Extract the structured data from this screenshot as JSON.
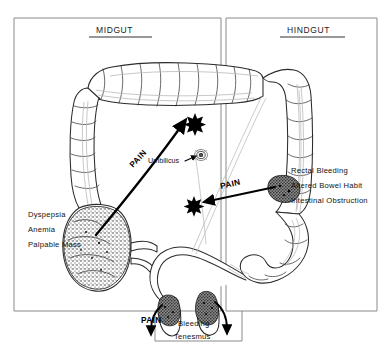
{
  "figure": {
    "background_color": "#ffffff",
    "ink_color": "#000000",
    "frame_color": "#8a8a8a"
  },
  "panels": {
    "left": {
      "title": "MIDGUT"
    },
    "right": {
      "title": "HINDGUT"
    }
  },
  "labels": {
    "umbilicus": "Umbilicus",
    "pain_midgut": "PAIN",
    "pain_hindgut": "PAIN",
    "pain_anal": "PAIN"
  },
  "midgut_symptoms": [
    "Dyspepsia",
    "Anemia",
    "Palpable Mass"
  ],
  "hindgut_symptoms": [
    "Rectal Bleeding",
    "Altered Bowel Habit",
    "Intestinal Obstruction"
  ],
  "anal_symptoms": [
    "Bleeding",
    "Tenesmus"
  ],
  "markers": {
    "midgut_referred_site": "star-marker",
    "hindgut_referred_site": "star-marker",
    "umbilicus_site": "umbilicus-marker"
  },
  "anatomy": {
    "transverse_colon": "transverse-colon",
    "ascending_colon": "ascending-colon",
    "descending_colon": "descending-colon",
    "sigmoid_colon": "sigmoid-colon",
    "cecum_tumor": "cecal-tumor",
    "sigmoid_tumor": "sigmoid-tumor",
    "rectal_tumor_left": "rectal-tumor-left",
    "rectal_tumor_right": "rectal-tumor-right"
  }
}
